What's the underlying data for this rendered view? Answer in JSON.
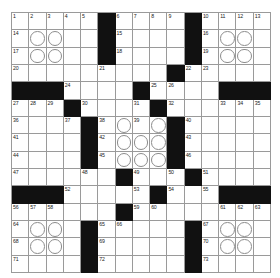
{
  "puzzle": {
    "type": "crossword-grid",
    "rows": 15,
    "columns": 15,
    "colors": {
      "block": "#111111",
      "cell": "#ffffff",
      "gridline": "#9a9a9a",
      "number": "#1a1a1a",
      "circle_stroke": "#8c8c8c"
    },
    "highest_number": "73",
    "cells": [
      [
        {
          "n": "1"
        },
        {
          "n": "2"
        },
        {
          "n": "3"
        },
        {
          "n": "4"
        },
        {
          "n": "5"
        },
        {
          "b": true
        },
        {
          "n": "6"
        },
        {
          "n": "7"
        },
        {
          "n": "8"
        },
        {
          "n": "9"
        },
        {
          "b": true
        },
        {
          "n": "10"
        },
        {
          "n": "11"
        },
        {
          "n": "12"
        },
        {
          "n": "13"
        }
      ],
      [
        {
          "n": "14"
        },
        {
          "c": true
        },
        {
          "c": true
        },
        {},
        {},
        {
          "b": true
        },
        {
          "n": "15"
        },
        {},
        {},
        {},
        {
          "b": true
        },
        {
          "n": "16"
        },
        {
          "c": true
        },
        {
          "c": true
        },
        {}
      ],
      [
        {
          "n": "17"
        },
        {
          "c": true
        },
        {
          "c": true
        },
        {},
        {},
        {
          "b": true
        },
        {
          "n": "18"
        },
        {},
        {},
        {},
        {
          "b": true
        },
        {
          "n": "19"
        },
        {
          "c": true
        },
        {
          "c": true
        },
        {}
      ],
      [
        {
          "n": "20"
        },
        {},
        {},
        {},
        {},
        {
          "n": "21"
        },
        {},
        {},
        {},
        {
          "b": true
        },
        {
          "n": "22"
        },
        {
          "n": "23"
        },
        {},
        {},
        {}
      ],
      [
        {
          "b": true
        },
        {
          "b": true
        },
        {
          "b": true
        },
        {
          "n": "24"
        },
        {},
        {},
        {},
        {
          "b": true
        },
        {
          "n": "25"
        },
        {
          "n": "26"
        },
        {},
        {},
        {
          "b": true
        },
        {
          "b": true
        },
        {
          "b": true
        }
      ],
      [
        {
          "n": "27"
        },
        {
          "n": "28"
        },
        {
          "n": "29"
        },
        {
          "b": true
        },
        {
          "n": "30"
        },
        {},
        {},
        {
          "n": "31"
        },
        {
          "b": true
        },
        {
          "n": "32"
        },
        {},
        {},
        {
          "n": "33"
        },
        {
          "n": "34"
        },
        {
          "n": "35"
        }
      ],
      [
        {
          "n": "36"
        },
        {},
        {},
        {
          "n": "37"
        },
        {
          "b": true
        },
        {
          "n": "38"
        },
        {
          "c": true
        },
        {
          "n": "39"
        },
        {
          "c": true
        },
        {
          "b": true
        },
        {
          "n": "40"
        },
        {},
        {},
        {},
        {}
      ],
      [
        {
          "n": "41"
        },
        {},
        {},
        {},
        {
          "b": true
        },
        {
          "n": "42"
        },
        {
          "c": true
        },
        {
          "c": true
        },
        {
          "c": true
        },
        {
          "b": true
        },
        {
          "n": "43"
        },
        {},
        {},
        {},
        {}
      ],
      [
        {
          "n": "44"
        },
        {},
        {},
        {},
        {
          "b": true
        },
        {
          "n": "45"
        },
        {
          "c": true
        },
        {
          "c": true
        },
        {
          "c": true
        },
        {
          "b": true
        },
        {
          "n": "46"
        },
        {},
        {},
        {},
        {}
      ],
      [
        {
          "n": "47"
        },
        {},
        {},
        {},
        {
          "n": "48"
        },
        {},
        {
          "b": true
        },
        {
          "n": "49"
        },
        {},
        {
          "n": "50"
        },
        {
          "b": true
        },
        {
          "n": "51"
        },
        {},
        {},
        {}
      ],
      [
        {
          "b": true
        },
        {
          "b": true
        },
        {
          "b": true
        },
        {
          "n": "52"
        },
        {},
        {},
        {},
        {
          "n": "53"
        },
        {
          "b": true
        },
        {
          "n": "54"
        },
        {},
        {
          "n": "55"
        },
        {
          "b": true
        },
        {
          "b": true
        },
        {
          "b": true
        }
      ],
      [
        {
          "n": "56"
        },
        {
          "n": "57"
        },
        {
          "n": "58"
        },
        {},
        {},
        {},
        {
          "b": true
        },
        {
          "n": "59"
        },
        {
          "n": "60"
        },
        {},
        {},
        {},
        {
          "n": "61"
        },
        {
          "n": "62"
        },
        {
          "n": "63"
        }
      ],
      [
        {
          "n": "64"
        },
        {
          "c": true
        },
        {
          "c": true
        },
        {},
        {
          "b": true
        },
        {
          "n": "65"
        },
        {
          "n": "66"
        },
        {},
        {},
        {},
        {
          "b": true
        },
        {
          "n": "67"
        },
        {
          "c": true
        },
        {
          "c": true
        },
        {}
      ],
      [
        {
          "n": "68"
        },
        {
          "c": true
        },
        {
          "c": true
        },
        {},
        {
          "b": true
        },
        {
          "n": "69"
        },
        {},
        {},
        {},
        {},
        {
          "b": true
        },
        {
          "n": "70"
        },
        {
          "c": true
        },
        {
          "c": true
        },
        {}
      ],
      [
        {
          "n": "71"
        },
        {},
        {},
        {},
        {
          "b": true
        },
        {
          "n": "72"
        },
        {},
        {},
        {},
        {},
        {
          "b": true
        },
        {
          "n": "73"
        },
        {},
        {},
        {}
      ]
    ]
  }
}
